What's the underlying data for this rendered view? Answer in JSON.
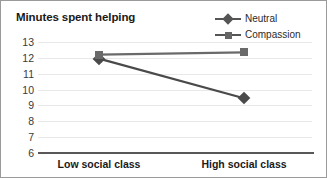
{
  "chart_data": {
    "type": "line",
    "title": "Minutes spent helping",
    "xlabel": "",
    "ylabel": "",
    "categories": [
      "Low social class",
      "High social class"
    ],
    "series": [
      {
        "name": "Neutral",
        "marker": "diamond",
        "values": [
          11.95,
          9.45
        ]
      },
      {
        "name": "Compassion",
        "marker": "square",
        "values": [
          12.2,
          12.35
        ]
      }
    ],
    "yticks": [
      13,
      12,
      11,
      10,
      9,
      8,
      7,
      6
    ],
    "ylim": [
      6,
      13
    ],
    "grid": true,
    "legend_position": "top-right",
    "colors": {
      "neutral_line": "#4a4a4a",
      "compassion_line": "#6a6a6a",
      "gridline": "#e8e8e8",
      "axis": "#585858",
      "border": "#9a9a9a",
      "text": "#1a1a1a"
    }
  },
  "legend": {
    "items": [
      {
        "label": "Neutral",
        "marker_icon": "diamond-marker-icon"
      },
      {
        "label": "Compassion",
        "marker_icon": "square-marker-icon"
      }
    ]
  }
}
